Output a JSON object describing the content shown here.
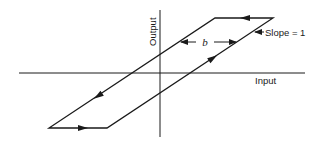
{
  "diagram": {
    "type": "hysteresis-loop",
    "axes": {
      "x_label": "Input",
      "y_label": "Output"
    },
    "annotations": {
      "width_label": "b",
      "slope_label": "Slope = 1"
    },
    "colors": {
      "line": "#1a1a1a",
      "background": "#ffffff"
    }
  }
}
